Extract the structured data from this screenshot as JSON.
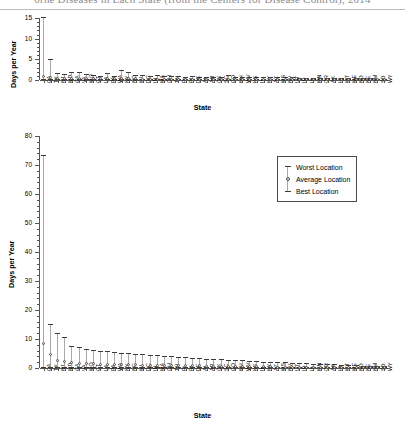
{
  "figure": {
    "title_clipped": "orne Diseases in Each State (from the Centers for Disease Control), 2014"
  },
  "legend": {
    "position": "inside-upper-right-of-lower-panel",
    "items": [
      {
        "label": "Worst Location",
        "glyph": "top-cap"
      },
      {
        "label": "Average Location",
        "glyph": "circle-marker"
      },
      {
        "label": "Best Location",
        "glyph": "bottom-cap"
      }
    ]
  },
  "colors": {
    "stem": "#a8a8a8",
    "cap": "#3a3a3a",
    "marker_fill": "#d9d9d9",
    "marker_edge": "#555555",
    "axis": "#555555",
    "text": "#000000"
  },
  "chart_data": [
    {
      "id": "upper-panel",
      "type": "bar",
      "title": "",
      "xlabel": "State",
      "ylabel": "Days per Year",
      "ylim": [
        0,
        15
      ],
      "yticks": [
        0,
        5,
        10,
        15
      ],
      "grid": false,
      "categories": [
        "CA",
        "TX",
        "NJ",
        "MD",
        "GA",
        "VA",
        "MO",
        "CT",
        "LA",
        "PA",
        "WA",
        "NY",
        "NC",
        "MI",
        "DC",
        "IN",
        "MA",
        "OH",
        "TN",
        "FL",
        "RI",
        "DE",
        "AL",
        "AR",
        "OK",
        "SC",
        "CO",
        "NH",
        "WV",
        "KS",
        "IL",
        "KY",
        "AZ",
        "MS",
        "NV",
        "UT",
        "ID",
        "IA",
        "MN",
        "OR",
        "AK",
        "HI",
        "MT",
        "ME",
        "ND",
        "NE",
        "NM",
        "SD",
        "WY"
      ],
      "series": [
        {
          "name": "Worst Location",
          "values": [
            15.0,
            4.8,
            1.4,
            1.3,
            1.8,
            1.6,
            1.2,
            0.9,
            0.8,
            1.5,
            0.7,
            2.1,
            1.6,
            1.0,
            0.9,
            0.8,
            1.0,
            0.8,
            0.8,
            0.7,
            0.6,
            0.7,
            0.6,
            0.6,
            0.6,
            0.5,
            1.0,
            0.5,
            0.5,
            0.5,
            0.5,
            0.4,
            0.5,
            0.4,
            0.4,
            0.4,
            0.3,
            0.3,
            0.3,
            0.3,
            0.3,
            0.2,
            0.2,
            0.2,
            0.2,
            0.2,
            0.2,
            0.1,
            0.1
          ]
        },
        {
          "name": "Average Location",
          "values": [
            0.8,
            0.5,
            0.4,
            0.4,
            0.4,
            0.4,
            0.3,
            0.3,
            0.3,
            0.3,
            0.3,
            0.3,
            0.3,
            0.3,
            0.2,
            0.2,
            0.2,
            0.2,
            0.2,
            0.2,
            0.2,
            0.2,
            0.2,
            0.2,
            0.1,
            0.1,
            0.1,
            0.1,
            0.1,
            0.1,
            0.1,
            0.1,
            0.1,
            0.1,
            0.1,
            0.1,
            0.1,
            0.1,
            0.1,
            0.1,
            0.05,
            0.05,
            0.05,
            0.05,
            0.05,
            0.05,
            0.05,
            0.03,
            0.03
          ]
        },
        {
          "name": "Best Location",
          "values": [
            0,
            0,
            0,
            0,
            0,
            0,
            0,
            0,
            0,
            0,
            0,
            0,
            0,
            0,
            0,
            0,
            0,
            0,
            0,
            0,
            0,
            0,
            0,
            0,
            0,
            0,
            0,
            0,
            0,
            0,
            0,
            0,
            0,
            0,
            0,
            0,
            0,
            0,
            0,
            0,
            0,
            0,
            0,
            0,
            0,
            0,
            0,
            0,
            0
          ]
        }
      ]
    },
    {
      "id": "lower-panel",
      "type": "bar",
      "title": "",
      "xlabel": "State",
      "ylabel": "Days per Year",
      "ylim": [
        0,
        80
      ],
      "yticks": [
        0,
        10,
        20,
        30,
        40,
        50,
        60,
        70,
        80
      ],
      "grid": false,
      "categories": [
        "CA",
        "TX",
        "NJ",
        "MD",
        "GA",
        "VA",
        "MO",
        "CT",
        "LA",
        "PA",
        "WA",
        "NY",
        "NC",
        "MI",
        "DC",
        "IN",
        "MA",
        "OH",
        "TN",
        "FL",
        "RI",
        "DE",
        "AL",
        "AR",
        "OK",
        "SC",
        "CO",
        "NH",
        "WV",
        "KS",
        "IL",
        "KY",
        "AZ",
        "MS",
        "NV",
        "UT",
        "ID",
        "IA",
        "MN",
        "OR",
        "AK",
        "HI",
        "MT",
        "ME",
        "ND",
        "NE",
        "NM",
        "SD",
        "WY"
      ],
      "series": [
        {
          "name": "Worst Location",
          "values": [
            73.0,
            15.0,
            11.8,
            10.2,
            7.2,
            7.0,
            6.2,
            5.9,
            5.6,
            5.4,
            5.2,
            5.0,
            4.8,
            4.6,
            4.4,
            4.2,
            4.0,
            3.8,
            3.7,
            3.5,
            3.3,
            3.2,
            3.0,
            2.9,
            2.8,
            2.6,
            2.5,
            2.4,
            2.3,
            2.2,
            2.0,
            1.9,
            1.8,
            1.7,
            1.6,
            1.5,
            1.4,
            1.3,
            1.2,
            1.1,
            1.0,
            0.9,
            0.8,
            0.7,
            0.6,
            0.5,
            0.4,
            0.3,
            0.2
          ]
        },
        {
          "name": "Average Location",
          "values": [
            8.5,
            4.5,
            2.5,
            2.2,
            1.8,
            1.6,
            1.5,
            1.4,
            1.3,
            1.3,
            1.2,
            1.2,
            1.1,
            1.1,
            1.0,
            1.0,
            0.9,
            0.9,
            0.8,
            0.8,
            0.8,
            0.7,
            0.7,
            0.6,
            0.6,
            0.6,
            0.5,
            0.5,
            0.5,
            0.4,
            0.4,
            0.4,
            0.4,
            0.3,
            0.3,
            0.3,
            0.3,
            0.2,
            0.2,
            0.2,
            0.2,
            0.2,
            0.15,
            0.15,
            0.1,
            0.1,
            0.1,
            0.08,
            0.05
          ]
        },
        {
          "name": "Best Location",
          "values": [
            0,
            0,
            0,
            0,
            0,
            0,
            0,
            0,
            0,
            0,
            0,
            0,
            0,
            0,
            0,
            0,
            0,
            0,
            0,
            0,
            0,
            0,
            0,
            0,
            0,
            0,
            0,
            0,
            0,
            0,
            0,
            0,
            0,
            0,
            0,
            0,
            0,
            0,
            0,
            0,
            0,
            0,
            0,
            0,
            0,
            0,
            0,
            0,
            0
          ]
        }
      ]
    }
  ]
}
